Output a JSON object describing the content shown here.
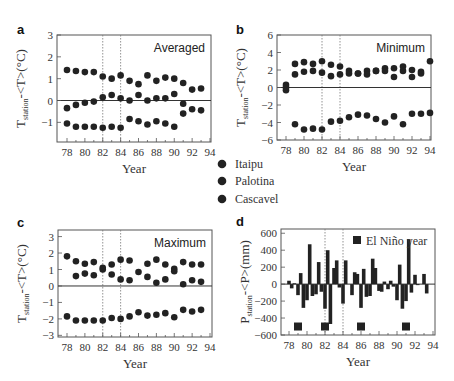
{
  "figure": {
    "legend": {
      "items": [
        {
          "label": "Itaipu",
          "marker": "filled-circle"
        },
        {
          "label": "Palotina",
          "marker": "filled-circle"
        },
        {
          "label": "Cascavel",
          "marker": "filled-circle"
        }
      ]
    }
  },
  "chart_data": [
    {
      "panel": "a",
      "type": "scatter",
      "title": "Averaged",
      "xlabel": "Year",
      "ylabel": "T_station - <T> (°C)",
      "xlim": [
        77,
        94
      ],
      "ylim": [
        -1.9,
        3
      ],
      "xticks": [
        78,
        80,
        82,
        84,
        86,
        88,
        90,
        92,
        94
      ],
      "yticks": [
        -1,
        0,
        1,
        2,
        3
      ],
      "vlines": [
        82,
        84
      ],
      "hline": 0,
      "x": [
        78,
        79,
        80,
        81,
        82,
        83,
        84,
        85,
        86,
        87,
        88,
        89,
        90,
        91,
        92,
        93
      ],
      "series": [
        {
          "name": "upper",
          "values": [
            1.4,
            1.35,
            1.3,
            1.3,
            1.1,
            1.0,
            1.15,
            0.9,
            0.75,
            1.15,
            0.9,
            1.05,
            1.0,
            0.8,
            0.5,
            0.55
          ]
        },
        {
          "name": "middle",
          "values": [
            -0.35,
            -0.2,
            -0.1,
            -0.05,
            0.15,
            0.25,
            0.1,
            0.0,
            0.25,
            0.0,
            0.1,
            0.1,
            0.3,
            -0.15,
            -0.4,
            -0.45
          ]
        },
        {
          "name": "lower",
          "values": [
            -1.05,
            -1.2,
            -1.2,
            -1.2,
            -1.25,
            -1.2,
            -1.25,
            -0.85,
            -0.95,
            -1.1,
            -0.95,
            -1.05,
            -1.2,
            -0.6,
            null,
            null
          ]
        }
      ]
    },
    {
      "panel": "b",
      "type": "scatter",
      "title": "Minimum",
      "xlabel": "Year",
      "ylabel": "T_station - <T> (°C)",
      "xlim": [
        77,
        94
      ],
      "ylim": [
        -6,
        6
      ],
      "xticks": [
        78,
        80,
        82,
        84,
        86,
        88,
        90,
        92,
        94
      ],
      "yticks": [
        -6,
        -4,
        -2,
        0,
        2,
        4,
        6
      ],
      "vlines": [
        82,
        84
      ],
      "hline": 0,
      "x": [
        78,
        79,
        80,
        81,
        82,
        83,
        84,
        85,
        86,
        87,
        88,
        89,
        90,
        91,
        92,
        93,
        94
      ],
      "series": [
        {
          "name": "upper",
          "values": [
            0.3,
            2.7,
            2.9,
            2.7,
            3.0,
            2.6,
            2.4,
            1.9,
            1.6,
            1.9,
            1.9,
            2.2,
            2.2,
            2.4,
            2.0,
            1.8,
            3.0
          ]
        },
        {
          "name": "middle",
          "values": [
            -0.3,
            1.5,
            1.8,
            1.9,
            1.7,
            1.3,
            1.5,
            1.6,
            1.6,
            1.5,
            1.9,
            1.9,
            1.2,
            1.9,
            1.2,
            1.6,
            null
          ]
        },
        {
          "name": "lower",
          "values": [
            0.0,
            -4.2,
            -4.8,
            -4.7,
            -4.8,
            -3.9,
            -3.8,
            -3.4,
            -3.1,
            -3.2,
            -3.6,
            -4.0,
            -3.3,
            -4.2,
            -3.0,
            -3.0,
            -2.9
          ]
        }
      ]
    },
    {
      "panel": "c",
      "type": "scatter",
      "title": "Maximum",
      "xlabel": "Year",
      "ylabel": "T_station - <T> (°C)",
      "xlim": [
        77,
        94
      ],
      "ylim": [
        -3.1,
        3.4
      ],
      "xticks": [
        78,
        80,
        82,
        84,
        86,
        88,
        90,
        92,
        94
      ],
      "yticks": [
        -3,
        -2,
        -1,
        0,
        1,
        2,
        3
      ],
      "vlines": [
        82,
        84
      ],
      "hline": 0,
      "x": [
        78,
        79,
        80,
        81,
        82,
        83,
        84,
        85,
        86,
        87,
        88,
        89,
        90,
        91,
        92,
        93
      ],
      "series": [
        {
          "name": "upper",
          "values": [
            1.8,
            1.5,
            1.35,
            1.45,
            1.1,
            1.3,
            1.6,
            1.55,
            0.85,
            1.35,
            1.6,
            1.3,
            1.05,
            1.45,
            1.3,
            1.3
          ]
        },
        {
          "name": "middle",
          "values": [
            null,
            0.6,
            0.75,
            0.65,
            1.0,
            0.7,
            0.4,
            0.35,
            null,
            0.55,
            0.2,
            0.4,
            0.9,
            0.1,
            0.35,
            0.25
          ]
        },
        {
          "name": "lower",
          "values": [
            -1.85,
            -2.1,
            -2.1,
            -2.1,
            -2.1,
            -1.95,
            -2.0,
            -1.85,
            -1.6,
            -1.8,
            -1.75,
            -1.65,
            -1.9,
            -1.45,
            -1.55,
            -1.45
          ]
        }
      ]
    },
    {
      "panel": "d",
      "type": "bar",
      "title": "",
      "legend_label": "El Niño year",
      "xlabel": "Year",
      "ylabel": "P_station - <P> (mm)",
      "xlim": [
        77,
        94
      ],
      "ylim": [
        -600,
        650
      ],
      "xticks": [
        78,
        80,
        82,
        84,
        86,
        88,
        90,
        92,
        94
      ],
      "yticks": [
        -600,
        -400,
        -200,
        0,
        200,
        400,
        600
      ],
      "vlines": [
        82,
        84
      ],
      "hline": 0,
      "x": [
        78.0,
        78.3,
        78.6,
        79.0,
        79.3,
        79.6,
        80.0,
        80.3,
        80.6,
        81.0,
        81.3,
        81.6,
        82.0,
        82.3,
        82.6,
        83.0,
        83.3,
        83.6,
        84.0,
        84.3,
        85.0,
        85.3,
        85.6,
        86.0,
        86.3,
        86.6,
        87.0,
        87.3,
        87.6,
        88.0,
        88.3,
        88.6,
        89.0,
        89.3,
        89.6,
        90.0,
        90.3,
        90.6,
        91.0,
        91.3,
        91.6,
        92.0,
        92.3,
        93.0,
        93.3
      ],
      "values": [
        40,
        -50,
        10,
        -130,
        130,
        -280,
        -190,
        470,
        -140,
        -120,
        260,
        -90,
        -290,
        400,
        -470,
        190,
        280,
        -40,
        -230,
        280,
        -130,
        140,
        120,
        -280,
        180,
        -150,
        -140,
        300,
        190,
        -80,
        -90,
        30,
        -60,
        40,
        -30,
        -190,
        230,
        -290,
        -200,
        530,
        -100,
        110,
        0,
        120,
        -110
      ],
      "el_nino_years": [
        79,
        82,
        86,
        91
      ],
      "el_nino_marker_y": -500
    }
  ]
}
